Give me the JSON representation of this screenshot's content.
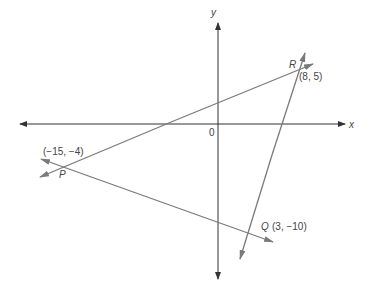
{
  "diagram": {
    "type": "coordinate-plane-triangle",
    "axes": {
      "x_label": "x",
      "y_label": "y",
      "origin_label": "0"
    },
    "points": [
      {
        "name": "R",
        "coords": "(8, 5)"
      },
      {
        "name": "P",
        "coords": "(−15, −4)"
      },
      {
        "name": "Q",
        "coords": "(3, −10)"
      }
    ],
    "lines": [
      {
        "name": "PR",
        "through": [
          "P",
          "R"
        ]
      },
      {
        "name": "PQ",
        "through": [
          "P",
          "Q"
        ]
      },
      {
        "name": "QR",
        "through": [
          "Q",
          "R"
        ]
      }
    ],
    "colors": {
      "axis": "#333333",
      "line": "#7a7a7a",
      "text": "#444444"
    }
  }
}
